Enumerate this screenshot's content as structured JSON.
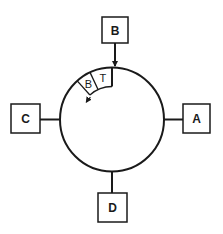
{
  "diagram": {
    "type": "token-ring",
    "colors": {
      "stroke": "#1a1a1a",
      "background": "#ffffff"
    },
    "ring": {
      "cx": 112,
      "cy": 119.5,
      "r": 52
    },
    "nodes": [
      {
        "id": "A",
        "label": "A",
        "position": "right",
        "box": {
          "x": 183,
          "y": 104,
          "w": 27,
          "h": 29
        },
        "link": {
          "x1": 164,
          "y1": 119.5,
          "x2": 183,
          "y2": 119.5
        }
      },
      {
        "id": "B",
        "label": "B",
        "position": "top",
        "box": {
          "x": 102,
          "y": 17,
          "w": 26,
          "h": 26
        },
        "link": {
          "x1": 115,
          "y1": 43,
          "x2": 115,
          "y2": 66
        },
        "arrow_into_ring": true
      },
      {
        "id": "C",
        "label": "C",
        "position": "left",
        "box": {
          "x": 11,
          "y": 104,
          "w": 29,
          "h": 29
        },
        "link": {
          "x1": 40,
          "y1": 119.5,
          "x2": 60,
          "y2": 119.5
        }
      },
      {
        "id": "D",
        "label": "D",
        "position": "bottom",
        "box": {
          "x": 98,
          "y": 193,
          "w": 29,
          "h": 29
        },
        "link": {
          "x1": 112,
          "y1": 171.5,
          "x2": 112,
          "y2": 193
        }
      }
    ],
    "frame": {
      "description": "Frame segment inside ring moving counter-clockwise",
      "inner_r": 33,
      "cells": [
        {
          "label": "T",
          "start_deg": 0,
          "end_deg": 25
        },
        {
          "label": "B",
          "start_deg": 25,
          "end_deg": 42
        }
      ],
      "direction": "counter-clockwise"
    }
  }
}
